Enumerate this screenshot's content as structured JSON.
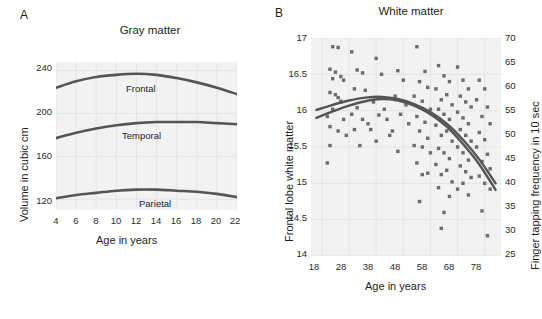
{
  "figure": {
    "background": "#ffffff",
    "plot_background": "#f2f2f2",
    "curve_color": "#555555",
    "marker_color": "#6b6b6b",
    "grid_color": "#e4e4e4"
  },
  "panels": {
    "a": {
      "letter": "A",
      "title": "Gray matter",
      "xlabel": "Age in years",
      "ylabel": "Volume in cubic cm"
    },
    "b": {
      "letter": "B",
      "title": "White matter",
      "xlabel": "Age in years",
      "ylabel": "Frontal lobe white matter",
      "y2label": "Finger tapping frequency in 10 sec"
    }
  },
  "chart_data": [
    {
      "type": "line",
      "panel": "A",
      "title": "Gray matter",
      "xlabel": "Age in years",
      "ylabel": "Volume in cubic cm",
      "xlim": [
        4,
        22
      ],
      "ylim": [
        110,
        248
      ],
      "xticks": [
        4,
        6,
        8,
        10,
        12,
        14,
        16,
        18,
        20,
        22
      ],
      "yticks": [
        120,
        160,
        200,
        240
      ],
      "grid": true,
      "legend": "inline-labels",
      "series": [
        {
          "name": "Frontal",
          "label_x": 12,
          "x": [
            4,
            6,
            8,
            10,
            12,
            14,
            16,
            18,
            20,
            22
          ],
          "values": [
            224,
            230,
            234,
            236,
            237,
            236,
            233,
            229,
            224,
            218
          ]
        },
        {
          "name": "Temporal",
          "label_x": 12,
          "x": [
            4,
            6,
            8,
            10,
            12,
            14,
            16,
            18,
            20,
            22
          ],
          "values": [
            177,
            182,
            186,
            189,
            191,
            192,
            192,
            192,
            191,
            190
          ]
        },
        {
          "name": "Parietal",
          "label_x": 14,
          "x": [
            4,
            6,
            8,
            10,
            12,
            14,
            16,
            18,
            20,
            22
          ],
          "values": [
            121,
            124,
            126,
            128,
            129,
            129,
            128,
            127,
            125,
            122
          ]
        }
      ]
    },
    {
      "type": "scatter",
      "panel": "B",
      "title": "White matter",
      "xlabel": "Age in years",
      "ylabel": "Frontal lobe white matter",
      "y2label": "Finger tapping frequency in 10 sec",
      "xlim": [
        14,
        84
      ],
      "ylim": [
        14.0,
        17.0
      ],
      "y2lim": [
        25,
        70
      ],
      "xticks": [
        18,
        28,
        38,
        48,
        58,
        68,
        78
      ],
      "yticks": [
        14.0,
        14.5,
        15.0,
        15.5,
        16.0,
        16.5,
        17.0
      ],
      "y2ticks": [
        25,
        30,
        35,
        40,
        45,
        50,
        55,
        60,
        65,
        70
      ],
      "grid": true,
      "marker": "square",
      "points": [
        [
          22,
          16.88
        ],
        [
          24,
          16.87
        ],
        [
          21,
          16.57
        ],
        [
          23,
          16.53
        ],
        [
          22,
          16.44
        ],
        [
          25,
          16.47
        ],
        [
          26,
          16.42
        ],
        [
          21,
          16.25
        ],
        [
          23,
          16.22
        ],
        [
          24,
          16.18
        ],
        [
          25,
          16.13
        ],
        [
          22,
          16.02
        ],
        [
          20,
          15.92
        ],
        [
          26,
          15.88
        ],
        [
          21,
          15.78
        ],
        [
          24,
          15.72
        ],
        [
          27,
          15.66
        ],
        [
          21,
          15.52
        ],
        [
          20,
          15.28
        ],
        [
          29,
          16.81
        ],
        [
          31,
          16.56
        ],
        [
          33,
          16.52
        ],
        [
          30,
          16.3
        ],
        [
          34,
          16.28
        ],
        [
          31,
          16.04
        ],
        [
          29,
          15.95
        ],
        [
          33,
          15.88
        ],
        [
          35,
          15.82
        ],
        [
          30,
          15.74
        ],
        [
          32,
          15.52
        ],
        [
          38,
          16.72
        ],
        [
          40,
          16.5
        ],
        [
          37,
          16.12
        ],
        [
          41,
          16.02
        ],
        [
          39,
          15.94
        ],
        [
          42,
          15.88
        ],
        [
          36,
          15.74
        ],
        [
          43,
          15.66
        ],
        [
          38,
          15.58
        ],
        [
          46,
          16.55
        ],
        [
          48,
          16.42
        ],
        [
          45,
          16.2
        ],
        [
          49,
          16.08
        ],
        [
          47,
          15.95
        ],
        [
          50,
          15.82
        ],
        [
          44,
          15.72
        ],
        [
          46,
          15.44
        ],
        [
          53,
          16.88
        ],
        [
          56,
          16.54
        ],
        [
          54,
          16.4
        ],
        [
          57,
          16.32
        ],
        [
          52,
          16.2
        ],
        [
          55,
          16.13
        ],
        [
          58,
          16.02
        ],
        [
          53,
          15.92
        ],
        [
          56,
          15.84
        ],
        [
          54,
          15.72
        ],
        [
          57,
          15.62
        ],
        [
          52,
          15.52
        ],
        [
          55,
          15.5
        ],
        [
          58,
          15.42
        ],
        [
          53,
          15.28
        ],
        [
          57,
          15.14
        ],
        [
          55,
          15.12
        ],
        [
          54,
          14.75
        ],
        [
          61,
          16.62
        ],
        [
          63,
          16.48
        ],
        [
          65,
          16.4
        ],
        [
          60,
          16.3
        ],
        [
          64,
          16.22
        ],
        [
          62,
          16.15
        ],
        [
          66,
          16.08
        ],
        [
          61,
          16.02
        ],
        [
          63,
          15.95
        ],
        [
          65,
          15.88
        ],
        [
          60,
          15.8
        ],
        [
          64,
          15.72
        ],
        [
          62,
          15.66
        ],
        [
          66,
          15.58
        ],
        [
          61,
          15.48
        ],
        [
          63,
          15.42
        ],
        [
          65,
          15.34
        ],
        [
          60,
          15.26
        ],
        [
          64,
          15.18
        ],
        [
          62,
          15.12
        ],
        [
          66,
          15.02
        ],
        [
          61,
          14.94
        ],
        [
          65,
          14.82
        ],
        [
          63,
          14.6
        ],
        [
          62,
          14.38
        ],
        [
          68,
          16.6
        ],
        [
          70,
          16.42
        ],
        [
          72,
          16.3
        ],
        [
          69,
          16.2
        ],
        [
          71,
          16.12
        ],
        [
          73,
          16.05
        ],
        [
          68,
          15.98
        ],
        [
          70,
          15.9
        ],
        [
          72,
          15.82
        ],
        [
          69,
          15.74
        ],
        [
          71,
          15.66
        ],
        [
          73,
          15.58
        ],
        [
          68,
          15.5
        ],
        [
          70,
          15.42
        ],
        [
          72,
          15.32
        ],
        [
          69,
          15.24
        ],
        [
          71,
          15.16
        ],
        [
          73,
          15.08
        ],
        [
          70,
          15.0
        ],
        [
          68,
          14.92
        ],
        [
          72,
          14.84
        ],
        [
          76,
          16.42
        ],
        [
          78,
          16.3
        ],
        [
          75,
          16.15
        ],
        [
          79,
          16.05
        ],
        [
          77,
          15.92
        ],
        [
          80,
          15.82
        ],
        [
          76,
          15.7
        ],
        [
          78,
          15.6
        ],
        [
          75,
          15.5
        ],
        [
          79,
          15.4
        ],
        [
          77,
          15.3
        ],
        [
          80,
          15.2
        ],
        [
          76,
          15.1
        ],
        [
          78,
          15.0
        ],
        [
          80,
          14.92
        ],
        [
          77,
          14.62
        ],
        [
          79,
          14.28
        ]
      ],
      "curves": [
        {
          "name": "upper-fit",
          "x": [
            16,
            22,
            28,
            34,
            40,
            46,
            52,
            58,
            64,
            70,
            76,
            82
          ],
          "values": [
            16.01,
            16.08,
            16.14,
            16.18,
            16.19,
            16.16,
            16.09,
            15.98,
            15.82,
            15.6,
            15.33,
            15.0
          ]
        },
        {
          "name": "lower-fit",
          "x": [
            16,
            22,
            28,
            34,
            40,
            46,
            52,
            58,
            64,
            70,
            76,
            82
          ],
          "values": [
            15.9,
            15.99,
            16.07,
            16.13,
            16.16,
            16.14,
            16.07,
            15.95,
            15.78,
            15.54,
            15.26,
            14.91
          ]
        }
      ]
    }
  ]
}
